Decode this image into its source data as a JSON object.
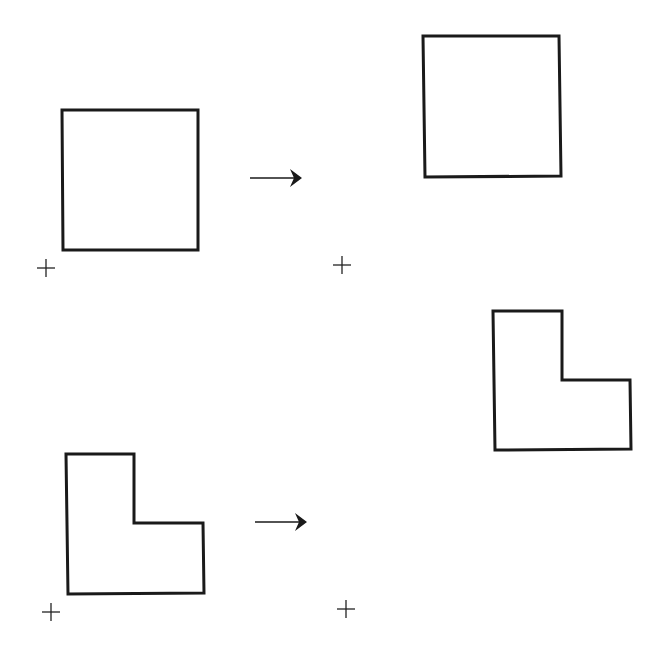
{
  "diagram": {
    "rows": [
      {
        "label": "square-translation",
        "before": {
          "shape": "square",
          "points": [
            [
              62,
              110
            ],
            [
              198,
              110
            ],
            [
              198,
              250
            ],
            [
              63,
              250
            ]
          ],
          "origin_mark": [
            46,
            268
          ]
        },
        "arrow": {
          "from": [
            250,
            178
          ],
          "to": [
            302,
            178
          ]
        },
        "after": {
          "shape": "square",
          "points": [
            [
              423,
              36
            ],
            [
              559,
              36
            ],
            [
              561,
              176
            ],
            [
              425,
              177
            ]
          ],
          "origin_mark": [
            342,
            265
          ]
        }
      },
      {
        "label": "l-shape-translation",
        "before": {
          "shape": "l-shape",
          "points": [
            [
              66,
              454
            ],
            [
              134,
              454
            ],
            [
              134,
              523
            ],
            [
              203,
              523
            ],
            [
              204,
              593
            ],
            [
              68,
              594
            ]
          ],
          "origin_mark": [
            51,
            612
          ]
        },
        "arrow": {
          "from": [
            255,
            522
          ],
          "to": [
            307,
            522
          ]
        },
        "after": {
          "shape": "l-shape",
          "points": [
            [
              493,
              311
            ],
            [
              562,
              311
            ],
            [
              562,
              380
            ],
            [
              630,
              380
            ],
            [
              631,
              449
            ],
            [
              495,
              450
            ]
          ],
          "origin_mark": [
            346,
            609
          ]
        }
      }
    ],
    "colors": {
      "stroke": "#1a1a1a",
      "background": "#ffffff"
    }
  }
}
